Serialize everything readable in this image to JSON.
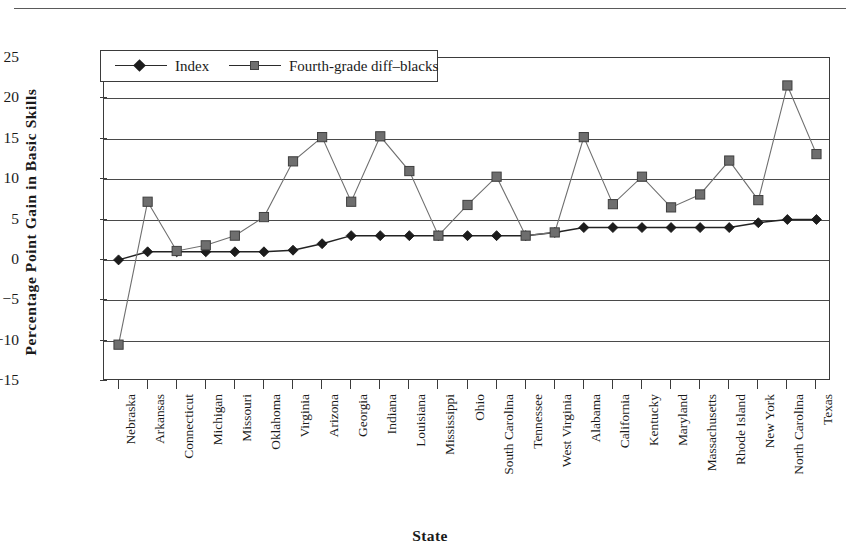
{
  "axis": {
    "y_title": "Percentage Point Gain in Basic Skills",
    "x_title": "State"
  },
  "legend": {
    "items": [
      {
        "label": "Index",
        "marker": "diamond-marker",
        "color": "#1c1c1c"
      },
      {
        "label": "Fourth-grade diff–blacks",
        "marker": "square-marker",
        "color": "#6e6e6e"
      }
    ]
  },
  "chart_data": {
    "type": "line",
    "title": "",
    "xlabel": "State",
    "ylabel": "Percentage Point Gain in Basic Skills",
    "ylim": [
      -15,
      25
    ],
    "yticks": [
      "25",
      "20",
      "15",
      "10",
      "5",
      "0",
      "−5",
      "−10",
      "−15"
    ],
    "ytick_values": [
      25,
      20,
      15,
      10,
      5,
      0,
      -5,
      -10,
      -15
    ],
    "grid": true,
    "legend_position": "top-left-inside",
    "categories": [
      "Nebraska",
      "Arkansas",
      "Connecticut",
      "Michigan",
      "Missouri",
      "Oklahoma",
      "Virginia",
      "Arizona",
      "Georgia",
      "Indiana",
      "Louisiana",
      "Mississippi",
      "Ohio",
      "South Carolina",
      "Tennessee",
      "West Virginia",
      "Alabama",
      "California",
      "Kentucky",
      "Maryland",
      "Massachusetts",
      "Rhode Island",
      "New York",
      "North Carolina",
      "Texas"
    ],
    "series": [
      {
        "name": "Index",
        "marker": "diamond",
        "color": "#1c1c1c",
        "values": [
          0.0,
          1.0,
          1.0,
          1.0,
          1.0,
          1.0,
          1.2,
          2.0,
          3.0,
          3.0,
          3.0,
          3.0,
          3.0,
          3.0,
          3.0,
          3.4,
          4.0,
          4.0,
          4.0,
          4.0,
          4.0,
          4.0,
          4.6,
          5.0,
          5.0
        ]
      },
      {
        "name": "Fourth-grade diff–blacks",
        "marker": "square",
        "color": "#6e6e6e",
        "values": [
          -10.5,
          7.2,
          1.1,
          1.8,
          3.0,
          5.3,
          12.2,
          15.2,
          7.2,
          15.3,
          11.0,
          3.0,
          6.8,
          10.3,
          3.0,
          3.4,
          15.2,
          6.9,
          10.3,
          6.5,
          8.1,
          12.3,
          7.4,
          21.6,
          13.1
        ]
      }
    ]
  }
}
